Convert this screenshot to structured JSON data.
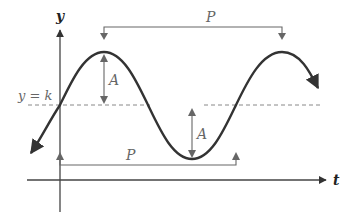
{
  "diagram": {
    "axes": {
      "y_label": "y",
      "x_label": "t"
    },
    "midline_label": "y = k",
    "amplitude_label_top": "A",
    "amplitude_label_bottom": "A",
    "period_label_top": "P",
    "period_label_bottom": "P",
    "colors": {
      "curve": "#333333",
      "axes": "#444444",
      "annotation": "#666666",
      "midline": "#888888"
    }
  }
}
